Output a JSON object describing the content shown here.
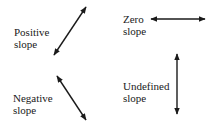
{
  "diagram": {
    "items": [
      {
        "id": "positive",
        "label_line1": "Positive",
        "label_line2": "slope",
        "arrow": {
          "x1": 54,
          "y1": 55,
          "x2": 86,
          "y2": 7
        }
      },
      {
        "id": "zero",
        "label_line1": "Zero",
        "label_line2": "slope",
        "arrow": {
          "x1": 151,
          "y1": 19,
          "x2": 205,
          "y2": 19
        }
      },
      {
        "id": "negative",
        "label_line1": "Negative",
        "label_line2": "slope",
        "arrow": {
          "x1": 57,
          "y1": 76,
          "x2": 86,
          "y2": 120
        }
      },
      {
        "id": "undefined",
        "label_line1": "Undefined",
        "label_line2": "slope",
        "arrow": {
          "x1": 177,
          "y1": 54,
          "x2": 177,
          "y2": 114
        }
      }
    ],
    "colors": {
      "line": "#1a1a1a",
      "background": "#ffffff"
    }
  }
}
